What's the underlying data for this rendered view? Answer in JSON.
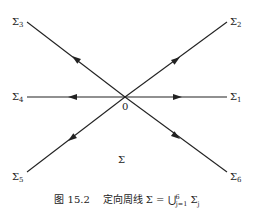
{
  "diagram": {
    "origin_label": "0",
    "region_label": "Σ",
    "rays": [
      {
        "id": "Sigma1",
        "label": "Σ",
        "index": "1",
        "direction": "right",
        "orientation": "outward"
      },
      {
        "id": "Sigma2",
        "label": "Σ",
        "index": "2",
        "direction": "up-right",
        "orientation": "outward"
      },
      {
        "id": "Sigma3",
        "label": "Σ",
        "index": "3",
        "direction": "up-left",
        "orientation": "outward"
      },
      {
        "id": "Sigma4",
        "label": "Σ",
        "index": "4",
        "direction": "left",
        "orientation": "outward"
      },
      {
        "id": "Sigma5",
        "label": "Σ",
        "index": "5",
        "direction": "down-left",
        "orientation": "outward"
      },
      {
        "id": "Sigma6",
        "label": "Σ",
        "index": "6",
        "direction": "down-right",
        "orientation": "outward"
      }
    ]
  },
  "caption": {
    "figure": "图 15.2",
    "text": "定向周线 Σ = ⋃",
    "sup": "6",
    "sub": "j=1",
    "tail": " Σ",
    "tail_sub": "j"
  }
}
